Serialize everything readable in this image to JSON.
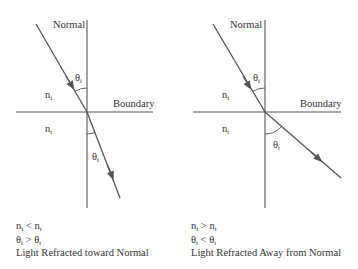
{
  "colors": {
    "line": "#555555",
    "text": "#333333",
    "background": "#ffffff"
  },
  "left_panel": {
    "normal_label": "Normal",
    "boundary_label": "Boundary",
    "incident_medium": {
      "symbol": "n",
      "subscript": "i"
    },
    "transmitted_medium": {
      "symbol": "n",
      "subscript": "t"
    },
    "incident_angle": {
      "symbol": "θ",
      "subscript": "i"
    },
    "transmitted_angle": {
      "symbol": "θ",
      "subscript": "t"
    },
    "caption": {
      "line1": {
        "a": "n",
        "a_sub": "i",
        "op": " < ",
        "b": "n",
        "b_sub": "t"
      },
      "line2": {
        "a": "θ",
        "a_sub": "i",
        "op": " > ",
        "b": "θ",
        "b_sub": "t"
      },
      "line3": "Light Refracted toward Normal"
    }
  },
  "right_panel": {
    "normal_label": "Normal",
    "boundary_label": "Boundary",
    "incident_medium": {
      "symbol": "n",
      "subscript": "i"
    },
    "transmitted_medium": {
      "symbol": "n",
      "subscript": "t"
    },
    "incident_angle": {
      "symbol": "θ",
      "subscript": "i"
    },
    "transmitted_angle": {
      "symbol": "θ",
      "subscript": "t"
    },
    "caption": {
      "line1": {
        "a": "n",
        "a_sub": "i",
        "op": " > ",
        "b": "n",
        "b_sub": "t"
      },
      "line2": {
        "a": "θ",
        "a_sub": "i",
        "op": " < ",
        "b": "θ",
        "b_sub": "t"
      },
      "line3": "Light Refracted Away from Normal"
    }
  }
}
